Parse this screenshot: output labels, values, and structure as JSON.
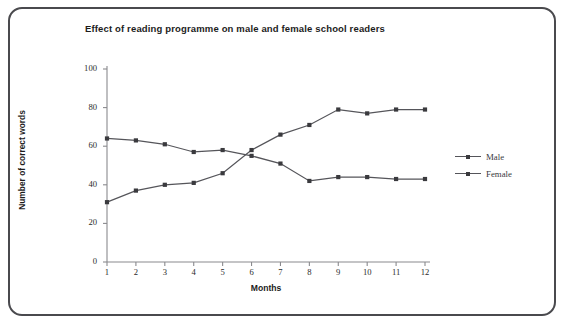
{
  "frame": {
    "border_color": "#4a4a4e"
  },
  "chart_data": {
    "type": "line",
    "title": "Effect of reading programme on male and female school readers",
    "xlabel": "Months",
    "ylabel": "Number of correct words",
    "categories": [
      "1",
      "2",
      "3",
      "4",
      "5",
      "6",
      "7",
      "8",
      "9",
      "10",
      "11",
      "12"
    ],
    "x": [
      1,
      2,
      3,
      4,
      5,
      6,
      7,
      8,
      9,
      10,
      11,
      12
    ],
    "xlim": [
      1,
      12
    ],
    "ylim": [
      0,
      100
    ],
    "yticks": [
      "0",
      "20",
      "40",
      "60",
      "80",
      "100"
    ],
    "ytick_values": [
      0,
      20,
      40,
      60,
      80,
      100
    ],
    "grid": false,
    "legend_position": "right",
    "series": [
      {
        "name": "Male",
        "color": "#55555a",
        "marker": "square",
        "values": [
          31,
          37,
          40,
          41,
          46,
          58,
          66,
          71,
          79,
          77,
          79,
          79
        ]
      },
      {
        "name": "Female",
        "color": "#55555a",
        "marker": "square",
        "values": [
          64,
          63,
          61,
          57,
          58,
          55,
          51,
          42,
          44,
          44,
          43,
          43
        ]
      }
    ]
  }
}
